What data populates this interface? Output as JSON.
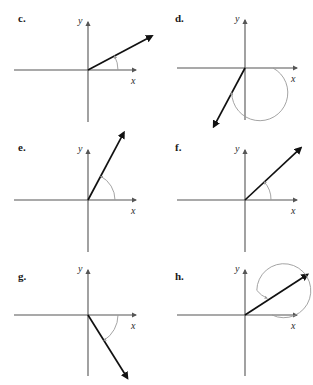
{
  "figure": {
    "type": "math-diagram-grid",
    "background_color": "#ffffff",
    "ray_color": "#111111",
    "axis_color": "#555555",
    "arc_color": "#9a9a9a",
    "columns": 2,
    "rows": 3
  },
  "panels": [
    {
      "id": "c",
      "label": "c.",
      "x_axis_label": "x",
      "y_axis_label": "y",
      "ray_angle_deg": 28,
      "ray_length": 72,
      "arc_type": "small-arc",
      "arc_radius": 30,
      "arc_start_deg": 0,
      "arc_end_deg": 28,
      "arc_direction": "counterclockwise"
    },
    {
      "id": "d",
      "label": "d.",
      "x_axis_label": "x",
      "y_axis_label": "y",
      "ray_angle_deg": -118,
      "ray_length": 66,
      "arc_type": "large-arc",
      "arc_radius": 28,
      "arc_start_deg": 0,
      "arc_end_deg": -118,
      "arc_direction": "clockwise"
    },
    {
      "id": "e",
      "label": "e.",
      "x_axis_label": "x",
      "y_axis_label": "y",
      "ray_angle_deg": 62,
      "ray_length": 76,
      "arc_type": "small-arc",
      "arc_radius": 27,
      "arc_start_deg": 0,
      "arc_end_deg": 62,
      "arc_direction": "counterclockwise"
    },
    {
      "id": "f",
      "label": "f.",
      "x_axis_label": "x",
      "y_axis_label": "y",
      "ray_angle_deg": 43,
      "ray_length": 76,
      "arc_type": "small-arc",
      "arc_radius": 26,
      "arc_start_deg": 0,
      "arc_end_deg": 43,
      "arc_direction": "counterclockwise"
    },
    {
      "id": "g",
      "label": "g.",
      "x_axis_label": "x",
      "y_axis_label": "y",
      "ray_angle_deg": -58,
      "ray_length": 74,
      "arc_type": "small-arc",
      "arc_radius": 30,
      "arc_start_deg": 0,
      "arc_end_deg": -58,
      "arc_direction": "clockwise"
    },
    {
      "id": "h",
      "label": "h.",
      "x_axis_label": "x",
      "y_axis_label": "y",
      "ray_angle_deg": 33,
      "ray_length": 74,
      "arc_type": "full-revolution-plus",
      "arc_radius": 27,
      "arc_start_deg": 0,
      "arc_end_deg": 393,
      "arc_direction": "counterclockwise"
    }
  ]
}
